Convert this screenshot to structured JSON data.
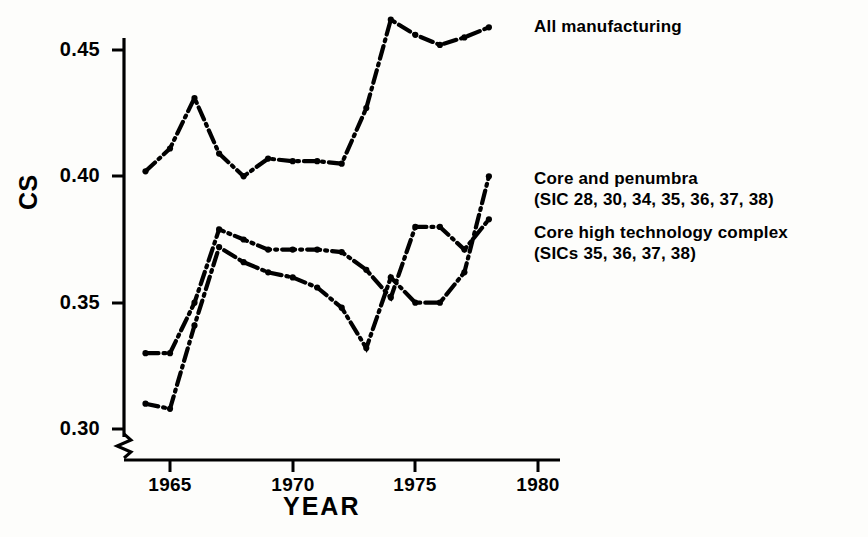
{
  "chart_data": {
    "type": "line",
    "title": "",
    "subtitle": "",
    "xlabel": "YEAR",
    "ylabel": "CS",
    "xlim": [
      1963.4,
      1980.6
    ],
    "ylim": [
      0.2945,
      0.4685
    ],
    "grid": false,
    "legend_position": "inline-right-of-lines",
    "xticks": [
      1965,
      1970,
      1975,
      1980
    ],
    "xtick_labels": [
      "1965",
      "1970",
      "1975",
      "1980"
    ],
    "yticks": [
      0.3,
      0.35,
      0.4,
      0.45
    ],
    "ytick_labels": [
      "0.30",
      "0.35",
      "0.40",
      "0.45"
    ],
    "y_axis_break": true,
    "marker": "dot",
    "linestyle": "dash-dot",
    "color": "#000000",
    "series": [
      {
        "name": "All manufacturing",
        "label_lines": [
          "All manufacturing"
        ],
        "x": [
          1964,
          1965,
          1966,
          1967,
          1968,
          1969,
          1970,
          1971,
          1972,
          1973,
          1974,
          1975,
          1976,
          1977,
          1978
        ],
        "values": [
          0.402,
          0.411,
          0.431,
          0.409,
          0.4,
          0.407,
          0.406,
          0.406,
          0.405,
          0.427,
          0.462,
          0.456,
          0.452,
          0.455,
          0.459
        ]
      },
      {
        "name": "Core and penumbra",
        "label_lines": [
          "Core and penumbra",
          "(SIC 28, 30, 34, 35, 36, 37, 38)"
        ],
        "x": [
          1964,
          1965,
          1966,
          1967,
          1968,
          1969,
          1970,
          1971,
          1972,
          1973,
          1974,
          1975,
          1976,
          1977,
          1978
        ],
        "values": [
          0.33,
          0.33,
          0.35,
          0.379,
          0.375,
          0.371,
          0.371,
          0.371,
          0.37,
          0.363,
          0.352,
          0.38,
          0.38,
          0.371,
          0.383
        ]
      },
      {
        "name": "Core high technology complex",
        "label_lines": [
          "Core high technology complex",
          "(SICs 35, 36, 37, 38)"
        ],
        "x": [
          1964,
          1965,
          1966,
          1967,
          1968,
          1969,
          1970,
          1971,
          1972,
          1973,
          1974,
          1975,
          1976,
          1977,
          1978
        ],
        "values": [
          0.31,
          0.308,
          0.341,
          0.372,
          0.366,
          0.362,
          0.36,
          0.356,
          0.348,
          0.332,
          0.36,
          0.35,
          0.35,
          0.362,
          0.4
        ]
      }
    ],
    "annotations": [
      {
        "text": "All manufacturing",
        "x": 1979.0,
        "y": 0.461
      },
      {
        "text": "Core and penumbra",
        "x": 1979.0,
        "y": 0.404
      },
      {
        "text": "(SIC 28, 30, 34, 35, 36, 37, 38)",
        "x": 1979.0,
        "y": 0.396
      },
      {
        "text": "Core high technology complex",
        "x": 1979.0,
        "y": 0.382
      },
      {
        "text": "(SICs 35, 36, 37, 38)",
        "x": 1979.0,
        "y": 0.374
      }
    ]
  },
  "axes": {
    "y_title": "CS",
    "x_title": "YEAR",
    "ytick_labels": [
      "0.45",
      "0.40",
      "0.35",
      "0.30"
    ],
    "xtick_labels": [
      "1965",
      "1970",
      "1975",
      "1980"
    ]
  },
  "legend": {
    "all_manufacturing": "All manufacturing",
    "core_penumbra_line1": "Core and penumbra",
    "core_penumbra_line2": "(SIC 28, 30, 34, 35, 36, 37, 38)",
    "core_high_tech_line1": "Core high technology complex",
    "core_high_tech_line2": "(SICs 35, 36, 37, 38)"
  }
}
